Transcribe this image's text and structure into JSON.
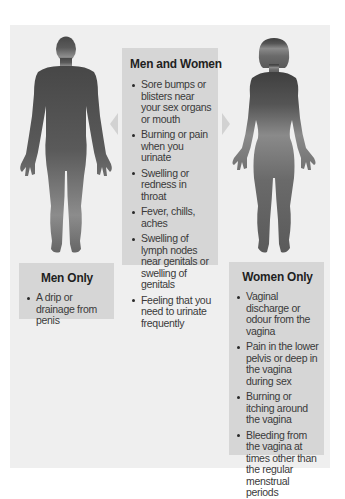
{
  "diagram": {
    "colors": {
      "page_background": "#ffffff",
      "panel_background": "#efefef",
      "box_background": "#d6d6d6",
      "silhouette_dark": "#4a4a4a",
      "silhouette_light": "#9a9a9a",
      "arrow": "#d2d2d2"
    },
    "figures": [
      {
        "label": "man-silhouette",
        "icon": "male-body-silhouette-icon"
      },
      {
        "label": "woman-silhouette",
        "icon": "female-body-silhouette-icon"
      }
    ],
    "arrows": [
      {
        "direction": "left",
        "icon": "triangle-left-icon"
      },
      {
        "direction": "right",
        "icon": "triangle-right-icon"
      }
    ],
    "men_and_women": {
      "title": "Men and Women",
      "items": [
        "Sore bumps or blisters near your sex organs or mouth",
        "Burning or pain when you urinate",
        "Swelling or redness in throat",
        "Fever, chills, aches",
        "Swelling of lymph nodes near genitals or swelling of genitals",
        "Feeling that you need to urinate frequently"
      ]
    },
    "men_only": {
      "title": "Men Only",
      "items": [
        "A drip or drainage from penis"
      ]
    },
    "women_only": {
      "title": "Women Only",
      "items": [
        "Vaginal discharge or odour from the vagina",
        "Pain in the lower pelvis or deep in the vagina during sex",
        "Burning or itching around the vagina",
        "Bleeding from the vagina at times other than the regular menstrual periods"
      ]
    }
  }
}
